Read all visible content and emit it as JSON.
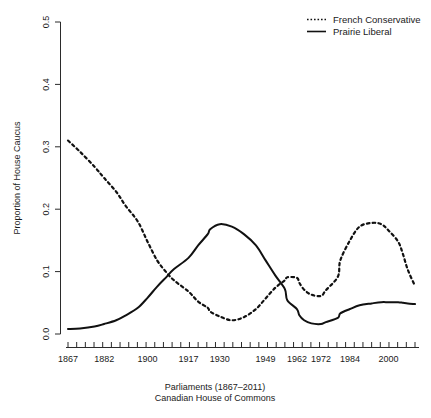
{
  "chart_data": {
    "type": "line",
    "title": "",
    "xlabel": "Parliaments (1867–2011)",
    "xlabel_line2": "Canadian House of Commons",
    "ylabel": "Proportion of House Caucus",
    "ylim": [
      0.0,
      0.5
    ],
    "xlim": [
      1867,
      2011
    ],
    "grid": false,
    "legend_position": "top-right",
    "y_ticks": [
      "0.0",
      "0.1",
      "0.2",
      "0.3",
      "0.4",
      "0.5"
    ],
    "y_tick_values": [
      0.0,
      0.1,
      0.2,
      0.3,
      0.4,
      0.5
    ],
    "x_ticks": [
      "1867",
      "1882",
      "1900",
      "1917",
      "1930",
      "1949",
      "1962",
      "1972",
      "1984",
      "2000"
    ],
    "x_tick_values": [
      1867,
      1882,
      1900,
      1917,
      1930,
      1949,
      1962,
      1972,
      1984,
      2000
    ],
    "x_minor_tick_count": 41,
    "series": [
      {
        "name": "French Conservative",
        "style": "dotted",
        "color": "#111111",
        "x": [
          1867,
          1872,
          1878,
          1882,
          1887,
          1891,
          1896,
          1900,
          1904,
          1908,
          1911,
          1917,
          1921,
          1925,
          1926,
          1930,
          1935,
          1940,
          1945,
          1949,
          1953,
          1957,
          1958,
          1962,
          1963,
          1965,
          1968,
          1972,
          1974,
          1979,
          1980,
          1984,
          1988,
          1993,
          1997,
          2000,
          2004,
          2006,
          2008,
          2011
        ],
        "values": [
          0.31,
          0.292,
          0.268,
          0.25,
          0.228,
          0.205,
          0.18,
          0.148,
          0.118,
          0.098,
          0.086,
          0.068,
          0.052,
          0.042,
          0.036,
          0.028,
          0.022,
          0.027,
          0.04,
          0.057,
          0.074,
          0.086,
          0.091,
          0.09,
          0.082,
          0.071,
          0.063,
          0.061,
          0.07,
          0.092,
          0.118,
          0.15,
          0.172,
          0.178,
          0.176,
          0.166,
          0.148,
          0.128,
          0.103,
          0.077
        ]
      },
      {
        "name": "Prairie Liberal",
        "style": "solid",
        "color": "#111111",
        "x": [
          1867,
          1872,
          1878,
          1882,
          1887,
          1891,
          1896,
          1900,
          1904,
          1908,
          1911,
          1917,
          1921,
          1925,
          1926,
          1930,
          1935,
          1940,
          1945,
          1949,
          1953,
          1957,
          1958,
          1962,
          1963,
          1965,
          1968,
          1972,
          1974,
          1979,
          1980,
          1984,
          1988,
          1993,
          1997,
          2000,
          2004,
          2006,
          2008,
          2011
        ],
        "values": [
          0.008,
          0.009,
          0.012,
          0.016,
          0.022,
          0.03,
          0.042,
          0.058,
          0.076,
          0.092,
          0.104,
          0.122,
          0.142,
          0.16,
          0.168,
          0.176,
          0.172,
          0.16,
          0.142,
          0.118,
          0.094,
          0.072,
          0.054,
          0.04,
          0.03,
          0.022,
          0.017,
          0.016,
          0.019,
          0.026,
          0.033,
          0.04,
          0.046,
          0.049,
          0.051,
          0.051,
          0.051,
          0.05,
          0.049,
          0.048
        ]
      }
    ],
    "annotations": []
  },
  "legend": {
    "entries": [
      {
        "label": "French Conservative",
        "style": "dotted"
      },
      {
        "label": "Prairie Liberal",
        "style": "solid"
      }
    ]
  }
}
